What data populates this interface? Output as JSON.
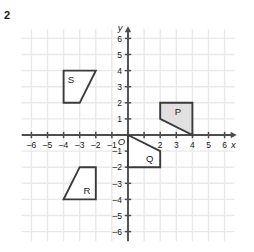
{
  "problem": {
    "number": "2"
  },
  "colors": {
    "grid_line": "#e9e9e9",
    "axis": "#4d4d4d",
    "shape_stroke": "#3a3a3a",
    "shape_fill_shaded": "#e0e0e0",
    "shape_fill_plain": "#ffffff",
    "label_text": "#1a1a1a",
    "background": "#ffffff"
  },
  "chart_data": {
    "type": "scatter",
    "title": "",
    "xlabel": "x",
    "ylabel": "y",
    "xlim": [
      -6.8,
      6.8
    ],
    "ylim": [
      -6.8,
      6.8
    ],
    "grid": true,
    "legend": false,
    "origin_label": "O",
    "xticks": [
      -6,
      -5,
      -4,
      -3,
      -2,
      -1,
      1,
      2,
      3,
      4,
      5,
      6
    ],
    "xtick_labels": [
      "–6",
      "–5",
      "–4",
      "–3",
      "–2",
      "–1",
      "1",
      "2",
      "3",
      "4",
      "5",
      "6"
    ],
    "yticks": [
      -6,
      -5,
      -4,
      -3,
      -2,
      -1,
      1,
      2,
      3,
      4,
      5,
      6
    ],
    "ytick_labels": [
      "–6",
      "–5",
      "–4",
      "–3",
      "–2",
      "–1",
      "1",
      "2",
      "3",
      "4",
      "5",
      "6"
    ],
    "shapes": [
      {
        "name": "P",
        "label": "P",
        "label_at": [
          3.1,
          1.45
        ],
        "fill": "shaded",
        "vertices": [
          [
            2,
            2
          ],
          [
            4,
            2
          ],
          [
            4,
            0
          ],
          [
            2,
            1
          ]
        ]
      },
      {
        "name": "S",
        "label": "S",
        "label_at": [
          -3.55,
          3.45
        ],
        "fill": "plain",
        "vertices": [
          [
            -4,
            4
          ],
          [
            -2,
            4
          ],
          [
            -3,
            2
          ],
          [
            -4,
            2
          ]
        ]
      },
      {
        "name": "Q",
        "label": "Q",
        "label_at": [
          1.35,
          -1.45
        ],
        "fill": "plain",
        "vertices": [
          [
            0,
            0
          ],
          [
            2,
            -1
          ],
          [
            2,
            -2
          ],
          [
            0,
            -2
          ]
        ]
      },
      {
        "name": "R",
        "label": "R",
        "label_at": [
          -2.55,
          -3.45
        ],
        "fill": "plain",
        "vertices": [
          [
            -3,
            -2
          ],
          [
            -2,
            -2
          ],
          [
            -2,
            -4
          ],
          [
            -4,
            -4
          ]
        ]
      }
    ]
  }
}
